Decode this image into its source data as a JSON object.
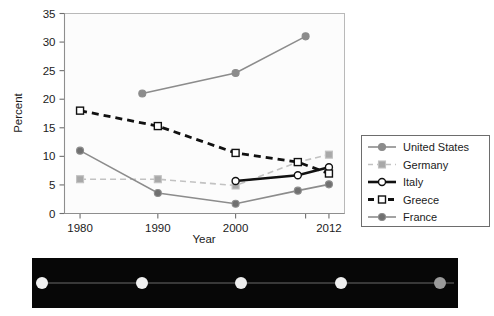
{
  "chart_data": {
    "type": "line",
    "title": "",
    "xlabel": "Year",
    "ylabel": "Percent",
    "xlim": [
      1978,
      2014
    ],
    "ylim": [
      0,
      35
    ],
    "ytick_values": [
      0,
      5,
      10,
      15,
      20,
      25,
      30,
      35
    ],
    "ytick_labels": [
      "0",
      "5",
      "10",
      "15",
      "20",
      "25",
      "30",
      "35"
    ],
    "xtick_values": [
      1980,
      1990,
      2000,
      2012
    ],
    "xtick_labels": [
      "1980",
      "1990",
      "2000",
      "2012"
    ],
    "x_minor_ticks": [
      1980,
      1990,
      2000,
      2009,
      2012
    ],
    "grid": false,
    "legend_position": "right-outside",
    "series": [
      {
        "name": "United States",
        "color": "#8c8c8c",
        "marker": "circle",
        "marker_fill": "#8c8c8c",
        "linestyle": "solid",
        "linewidth": 1.6,
        "x": [
          1988,
          2000,
          2009
        ],
        "y": [
          21.0,
          24.6,
          31.0
        ]
      },
      {
        "name": "Germany",
        "color": "#c2c2c2",
        "marker": "square",
        "marker_fill": "#a8a8a8",
        "linestyle": "dashed",
        "linewidth": 1.6,
        "x": [
          1980,
          1990,
          2000,
          2008,
          2012
        ],
        "y": [
          6.0,
          6.0,
          4.9,
          9.0,
          10.3
        ]
      },
      {
        "name": "Italy",
        "color": "#111111",
        "marker": "circle",
        "marker_fill": "#ffffff",
        "linestyle": "solid",
        "linewidth": 2.6,
        "x": [
          2000,
          2008,
          2012
        ],
        "y": [
          5.7,
          6.7,
          8.1
        ]
      },
      {
        "name": "Greece",
        "color": "#111111",
        "marker": "square",
        "marker_fill": "#ffffff",
        "linestyle": "dashed",
        "linewidth": 2.8,
        "x": [
          1980,
          1990,
          2000,
          2008,
          2012
        ],
        "y": [
          18.0,
          15.3,
          10.6,
          9.0,
          7.0
        ]
      },
      {
        "name": "France",
        "color": "#8c8c8c",
        "marker": "circle",
        "marker_fill": "#707070",
        "linestyle": "solid",
        "linewidth": 1.6,
        "x": [
          1980,
          1990,
          2000,
          2008,
          2012
        ],
        "y": [
          11.0,
          3.6,
          1.7,
          4.0,
          5.1
        ]
      }
    ]
  },
  "legend": {
    "items": [
      {
        "label": "United States"
      },
      {
        "label": "Germany"
      },
      {
        "label": "Italy"
      },
      {
        "label": "Greece"
      },
      {
        "label": "France"
      }
    ]
  },
  "image_strip": {
    "background_color": "#070707",
    "dots": [
      {
        "color": "#f2f2f2"
      },
      {
        "color": "#f0f0f0"
      },
      {
        "color": "#ededed"
      },
      {
        "color": "#efefef"
      },
      {
        "color": "#9a9a9a"
      }
    ]
  }
}
